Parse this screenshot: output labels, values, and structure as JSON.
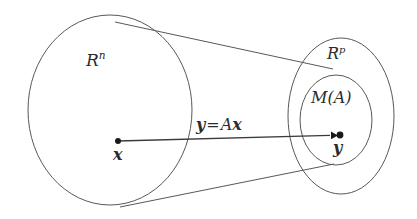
{
  "figure": {
    "background_color": "#ffffff",
    "stroke_color": "#585858",
    "text_color": "#2b2b2b",
    "width": 417,
    "height": 219
  },
  "labels": {
    "domain_space": {
      "base": "R",
      "exponent": "n",
      "full": "Rⁿ"
    },
    "codomain_space": {
      "base": "R",
      "exponent": "p",
      "full": "Rᵖ"
    },
    "image_set": "M(A)",
    "equation": {
      "lhs": "y",
      "operator": "=",
      "matrix": "A",
      "rhs": "x",
      "full": "y = Ax"
    },
    "source_point": "x",
    "target_point": "y"
  },
  "shapes": {
    "domain_ellipse": {
      "name": "R^n",
      "cx": 110,
      "cy": 110,
      "rx": 82,
      "ry": 95
    },
    "codomain_ellipse": {
      "name": "R^p",
      "cx": 341,
      "cy": 116,
      "rx": 53,
      "ry": 78
    },
    "image_ellipse": {
      "name": "M(A)",
      "cx": 336,
      "cy": 120,
      "rx": 36,
      "ry": 45
    },
    "tangent_top": {
      "x1": 115,
      "y1": 22,
      "x2": 333,
      "y2": 69
    },
    "tangent_bottom": {
      "x1": 120,
      "y1": 207,
      "x2": 334,
      "y2": 164
    },
    "map_arrow": {
      "x1": 118,
      "y1": 141,
      "x2": 338,
      "y2": 135
    }
  }
}
